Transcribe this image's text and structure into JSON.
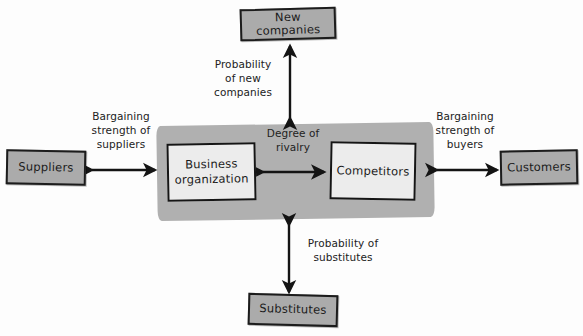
{
  "diagram": {
    "colors": {
      "node_fill": "#ababab",
      "inner_fill": "#ececec",
      "band_fill": "#b0b0b0",
      "stroke": "#1c1c1c",
      "text": "#1a1a1a",
      "background": "#fdfdfd"
    },
    "nodes": {
      "new_companies": "New companies",
      "suppliers": "Suppliers",
      "customers": "Customers",
      "substitutes": "Substitutes",
      "business_organization": "Business\norganization",
      "competitors": "Competitors"
    },
    "edge_labels": {
      "probability_of_new_companies": "Probability\nof new\ncompanies",
      "bargaining_strength_of_suppliers": "Bargaining\nstrength of\nsuppliers",
      "bargaining_strength_of_buyers": "Bargaining\nstrength of\nbuyers",
      "degree_of_rivalry": "Degree of\nrivalry",
      "probability_of_substitutes": "Probability of\nsubstitutes"
    }
  }
}
